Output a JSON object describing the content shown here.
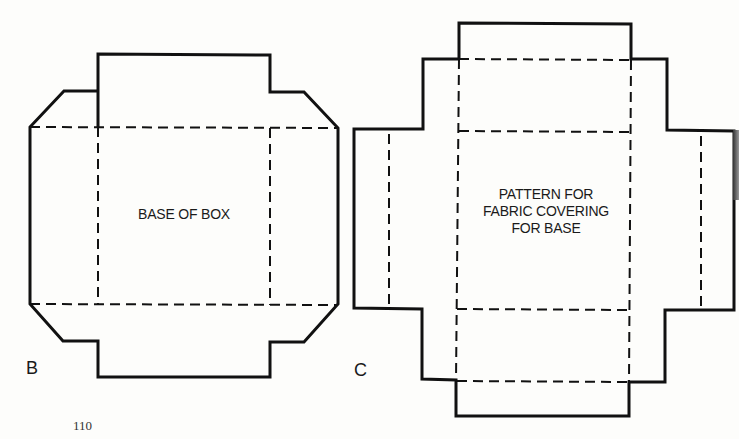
{
  "figures": [
    {
      "id": "B",
      "letter": "B",
      "label": "BASE OF BOX"
    },
    {
      "id": "C",
      "letter": "C",
      "label_lines": [
        "PATTERN FOR",
        "FABRIC COVERING",
        "FOR BASE"
      ]
    }
  ],
  "page_number": "110",
  "colors": {
    "line": "#111111",
    "background": "#fdfdfb"
  }
}
